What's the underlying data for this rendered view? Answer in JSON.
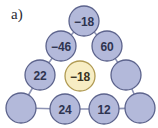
{
  "figure": {
    "part_label": "a)",
    "colors": {
      "background": "#ffffff",
      "node_fill": "#b3b9da",
      "node_fill_highlight": "#f7edc4",
      "node_stroke": "#5c638c",
      "node_stroke_highlight": "#b09a52",
      "edge_stroke": "#8d93b4",
      "text": "#2e3450",
      "text_highlight": "#3a3322",
      "label_text": "#2a2a33"
    },
    "geometry": {
      "width": 158,
      "height": 128,
      "node_radius": 15
    }
  },
  "chart_data": {
    "type": "diagram",
    "title": "",
    "subtitle": "",
    "nodes": [
      {
        "id": "n1",
        "row": 1,
        "index": 0,
        "label": "−18",
        "value": -18,
        "empty": false,
        "highlight": false,
        "cx": 84,
        "cy": 21
      },
      {
        "id": "n2",
        "row": 2,
        "index": 0,
        "label": "−46",
        "value": -46,
        "empty": false,
        "highlight": false,
        "cx": 61,
        "cy": 46
      },
      {
        "id": "n3",
        "row": 2,
        "index": 1,
        "label": "60",
        "value": 60,
        "empty": false,
        "highlight": false,
        "cx": 107,
        "cy": 46
      },
      {
        "id": "n4",
        "row": 3,
        "index": 0,
        "label": "22",
        "value": 22,
        "empty": false,
        "highlight": false,
        "cx": 40,
        "cy": 75
      },
      {
        "id": "n5",
        "row": 3,
        "index": 1,
        "label": "−18",
        "value": -18,
        "empty": false,
        "highlight": true,
        "cx": 80,
        "cy": 76
      },
      {
        "id": "n6",
        "row": 3,
        "index": 2,
        "label": "",
        "value": null,
        "empty": true,
        "highlight": false,
        "cx": 126,
        "cy": 75
      },
      {
        "id": "n7",
        "row": 4,
        "index": 0,
        "label": "",
        "value": null,
        "empty": true,
        "highlight": false,
        "cx": 21,
        "cy": 108
      },
      {
        "id": "n8",
        "row": 4,
        "index": 1,
        "label": "24",
        "value": 24,
        "empty": false,
        "highlight": false,
        "cx": 65,
        "cy": 109
      },
      {
        "id": "n9",
        "row": 4,
        "index": 2,
        "label": "12",
        "value": 12,
        "empty": false,
        "highlight": false,
        "cx": 104,
        "cy": 109
      },
      {
        "id": "n10",
        "row": 4,
        "index": 3,
        "label": "",
        "value": null,
        "empty": true,
        "highlight": false,
        "cx": 140,
        "cy": 108
      }
    ],
    "edges": [
      {
        "from": "n1",
        "to": "n2"
      },
      {
        "from": "n1",
        "to": "n3"
      },
      {
        "from": "n2",
        "to": "n4"
      },
      {
        "from": "n3",
        "to": "n6"
      },
      {
        "from": "n4",
        "to": "n7"
      },
      {
        "from": "n6",
        "to": "n10"
      },
      {
        "from": "n7",
        "to": "n8"
      },
      {
        "from": "n8",
        "to": "n9"
      },
      {
        "from": "n9",
        "to": "n10"
      }
    ]
  }
}
